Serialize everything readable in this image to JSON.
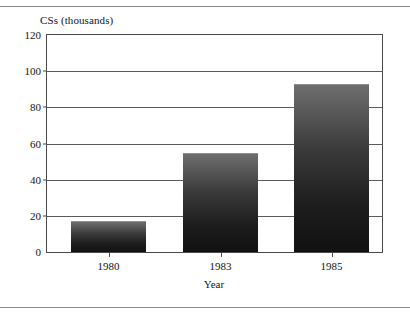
{
  "figure": {
    "background_color": "#ffffff",
    "frame_color": "#8a8a8a",
    "axis_color": "#4a4a4a",
    "grid_color": "#5a5a5a",
    "text_color": "#141414"
  },
  "chart_data": {
    "type": "bar",
    "title": "",
    "subtitle": "",
    "xlabel": "Year",
    "ylabel": "CSs (thousands)",
    "categories": [
      "1980",
      "1983",
      "1985"
    ],
    "values": [
      17,
      55,
      93
    ],
    "series": [
      {
        "name": "CSs (thousands)",
        "values": [
          17,
          55,
          93
        ]
      }
    ],
    "ylim": [
      0,
      120
    ],
    "yticks": [
      0,
      20,
      40,
      60,
      80,
      100,
      120
    ],
    "ytick_labels": [
      "0",
      "20",
      "40",
      "60",
      "80",
      "100",
      "120"
    ],
    "xtick_labels": [
      "1980",
      "1983",
      "1985"
    ],
    "grid": "horizontal",
    "legend": "none",
    "legend_position": "none",
    "bar_fill": "vertical-gradient-gray-to-black",
    "bar_gradient_top": "#6e6e6e",
    "bar_gradient_bottom": "#111111",
    "annotations": []
  }
}
